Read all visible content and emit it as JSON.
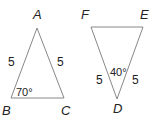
{
  "figure": {
    "triangle_abc": {
      "vertices": {
        "A": "A",
        "B": "B",
        "C": "C"
      },
      "side_ab": "5",
      "side_ac": "5",
      "angle_b": "70°",
      "stroke": "#888888"
    },
    "triangle_def": {
      "vertices": {
        "D": "D",
        "E": "E",
        "F": "F"
      },
      "side_fd": "5",
      "side_ed": "5",
      "angle_d": "40°",
      "stroke": "#888888"
    }
  }
}
